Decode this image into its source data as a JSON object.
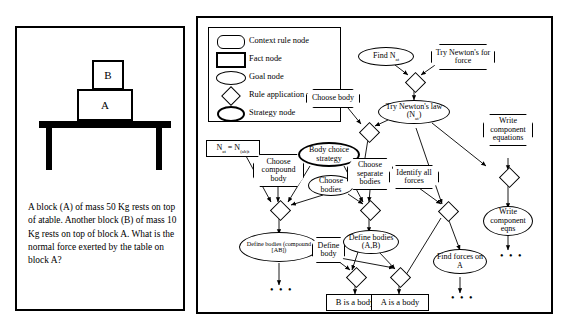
{
  "left_panel": {
    "illustration": {
      "block_top_label": "B",
      "block_bottom_label": "A"
    },
    "problem_text": "A block (A) of mass 50 Kg rests on top of atable. Another block (B) of mass 10 Kg rests on top of block A. What is the normal force exerted by the table on block A?"
  },
  "legend": {
    "items": [
      {
        "symbol": "context-rule-shape",
        "label": "Context rule node"
      },
      {
        "symbol": "fact-shape",
        "label": "Fact node"
      },
      {
        "symbol": "goal-shape",
        "label": "Goal node"
      },
      {
        "symbol": "rule-application-shape",
        "label": "Rule application node"
      },
      {
        "symbol": "strategy-shape",
        "label": "Strategy node"
      }
    ]
  },
  "graph": {
    "nodes": {
      "find_n": "Find N",
      "find_n_sub": "at",
      "try_newton_force": "Try Newton's for force",
      "try_newton_law": "Try Newton's law (N",
      "try_newton_law_sub": "at",
      "try_newton_law_end": ")",
      "choose_body": "Choose body",
      "write_component_equations": "Write component equations",
      "fact_equation_lhs": "N",
      "fact_equation_lhs_sub": "at",
      "fact_equation_mid": " = N",
      "fact_equation_rhs_sub": "(ab)t",
      "choose_compound_body": "Choose compound body",
      "body_choice_strategy": "Body choice strategy",
      "choose_bodies": "Choose bodies",
      "choose_separate_bodies": "Choose separate bodies",
      "identify_all_forces": "Identify all forces",
      "define_bodies_compound": "Define bodies (compound [AB])",
      "define_body": "Define body",
      "define_bodies_ab": "Define bodies (A,B)",
      "b_is_a_body": "B is a body",
      "a_is_a_body": "A is a body",
      "find_forces_on_a": "Find forces on A",
      "write_component_eqns": "Write component eqns",
      "ellipsis": "• • •"
    }
  }
}
